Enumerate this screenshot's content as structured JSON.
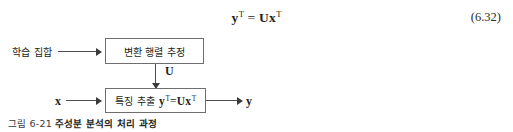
{
  "equation": {
    "lhs_var": "y",
    "lhs_sup": "T",
    "operator": "=",
    "rhs_matrix": "U",
    "rhs_var": "x",
    "rhs_sup": "T",
    "number": "(6.32)"
  },
  "diagram": {
    "input_training_set_label": "학습 집합",
    "box_transform_matrix_label": "변환 행렬 추정",
    "edge_u_label": "U",
    "box_feature_extract_label": "특징 추출",
    "box_feature_extract_formula": {
      "lhs_var": "y",
      "lhs_sup": "T",
      "operator": "=",
      "rhs_matrix": "U",
      "rhs_var": "x",
      "rhs_sup": "T"
    },
    "input_x_label": "x",
    "output_y_label": "y"
  },
  "caption": {
    "number": "그림 6-21",
    "title": "주성분 분석의 처리 과정"
  },
  "colors": {
    "text": "#231f20",
    "box_border": "#6e6e6e",
    "arrow": "#4d4d4d",
    "background": "#ffffff"
  }
}
